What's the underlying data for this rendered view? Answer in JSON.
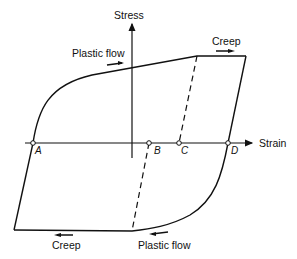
{
  "diagram": {
    "axes": {
      "y_label": "Stress",
      "x_label": "Strain"
    },
    "annotations": {
      "top_left": "Plastic flow",
      "top_right": "Creep",
      "bottom_left": "Creep",
      "bottom_right": "Plastic flow"
    },
    "points": {
      "a": "A",
      "b": "B",
      "c": "C",
      "d": "D"
    },
    "colors": {
      "line": "#111111",
      "background": "#ffffff"
    }
  }
}
